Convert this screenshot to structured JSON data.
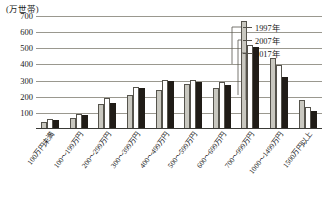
{
  "chart_data": {
    "type": "bar",
    "title": "",
    "subtitle": "",
    "unit_label": "(万世帯)",
    "xlabel": "",
    "ylabel": "",
    "ylim": [
      0,
      700
    ],
    "yticks": [
      100,
      200,
      300,
      400,
      500,
      600,
      700
    ],
    "grid": true,
    "legend_position": "top-right",
    "categories": [
      "100万円未満",
      "100〜199万円",
      "200〜299万円",
      "300〜399万円",
      "400〜499万円",
      "500〜599万円",
      "600〜699万円",
      "700〜999万円",
      "1000〜1499万円",
      "1500万円以上"
    ],
    "series": [
      {
        "name": "1997年",
        "color": "#c9c8c0",
        "values": [
          38,
          62,
          148,
          205,
          238,
          272,
          248,
          660,
          432,
          176
        ]
      },
      {
        "name": "2007年",
        "color": "#ffffff",
        "values": [
          55,
          88,
          188,
          252,
          300,
          300,
          282,
          516,
          388,
          132
        ]
      },
      {
        "name": "2017年",
        "color": "#201c17",
        "values": [
          52,
          80,
          152,
          248,
          290,
          284,
          268,
          500,
          318,
          104
        ]
      }
    ]
  },
  "legend": {
    "items": [
      {
        "label": "1997年"
      },
      {
        "label": "2007年"
      },
      {
        "label": "2017年"
      }
    ]
  }
}
